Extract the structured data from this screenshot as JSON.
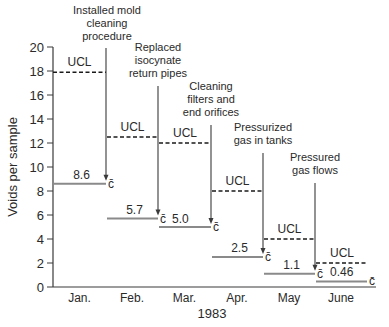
{
  "chart_data": {
    "type": "line",
    "title": "",
    "xlabel": "1983",
    "ylabel": "Voids per sample",
    "ylim": [
      0,
      20
    ],
    "yticks": [
      0,
      2,
      4,
      6,
      8,
      10,
      12,
      14,
      16,
      18,
      20
    ],
    "grid": false,
    "categories": [
      "Jan.",
      "Feb.",
      "Mar.",
      "Apr.",
      "May",
      "June"
    ],
    "series": [
      {
        "name": "c̄ (average voids per sample)",
        "values": [
          8.6,
          5.7,
          5.0,
          2.5,
          1.1,
          0.46
        ],
        "style": "solid-gray"
      },
      {
        "name": "UCL (upper control limit)",
        "values": [
          17.9,
          12.5,
          12.0,
          8.0,
          4.0,
          2.0
        ],
        "style": "dashed-black"
      }
    ],
    "value_labels": [
      "8.6",
      "5.7",
      "5.0",
      "2.5",
      "1.1",
      "0.46"
    ],
    "ucl_label": "UCL",
    "cbar_label": "c̄",
    "annotations": [
      {
        "text": [
          "Installed mold",
          "cleaning",
          "procedure"
        ],
        "between": [
          "Jan.",
          "Feb."
        ]
      },
      {
        "text": [
          "Replaced",
          "isocynate",
          "return pipes"
        ],
        "between": [
          "Feb.",
          "Mar."
        ]
      },
      {
        "text": [
          "Cleaning",
          "filters and",
          "end orifices"
        ],
        "between": [
          "Mar.",
          "Apr."
        ]
      },
      {
        "text": [
          "Pressurized",
          "gas in tanks"
        ],
        "between": [
          "Apr.",
          "May"
        ]
      },
      {
        "text": [
          "Pressured",
          "gas flows"
        ],
        "between": [
          "May",
          "June"
        ]
      }
    ]
  },
  "colors": {
    "axis": "#3a3a3a",
    "cbar_line": "#8a8a8a",
    "ucl_line": "#1a1a1a",
    "text": "#2a2a2a"
  }
}
